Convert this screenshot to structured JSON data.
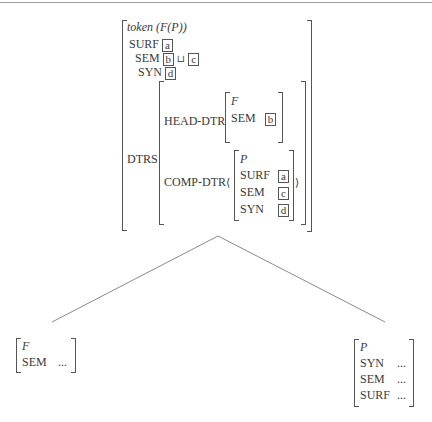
{
  "root": {
    "type_label": "token (F(P))",
    "features": [
      {
        "attr": "SURF",
        "value_tags": [
          "a"
        ]
      },
      {
        "attr": "SEM",
        "value_tags": [
          "b",
          "c"
        ],
        "operator": "⊔"
      },
      {
        "attr": "SYN",
        "value_tags": [
          "d"
        ]
      }
    ],
    "dtrs": {
      "label": "DTRS",
      "head_dtr": {
        "label": "HEAD-DTR",
        "type": "F",
        "features": [
          {
            "attr": "SEM",
            "tag": "b"
          }
        ]
      },
      "comp_dtr": {
        "label": "COMP-DTR",
        "open_angle": "⟨",
        "close_angle": "⟩",
        "type": "P",
        "features": [
          {
            "attr": "SURF",
            "tag": "a"
          },
          {
            "attr": "SEM",
            "tag": "c"
          },
          {
            "attr": "SYN",
            "tag": "d"
          }
        ]
      }
    }
  },
  "left_child": {
    "type": "F",
    "features": [
      {
        "attr": "SEM",
        "value": "..."
      }
    ]
  },
  "right_child": {
    "type": "P",
    "features": [
      {
        "attr": "SYN",
        "value": "..."
      },
      {
        "attr": "SEM",
        "value": "..."
      },
      {
        "attr": "SURF",
        "value": "..."
      }
    ]
  }
}
